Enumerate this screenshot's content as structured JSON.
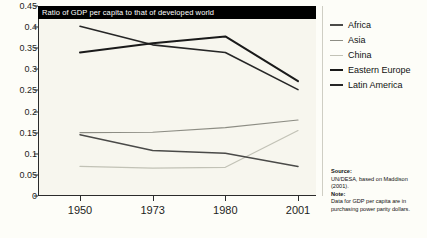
{
  "chart": {
    "title": "Ratio of GDP per capita to that of developed world",
    "source_heading": "Source:",
    "source_text": "UN/DESA, based on Maddison (2001).",
    "note_heading": "Note:",
    "note_text": "Data for GDP per capita are in purchasing power parity dollars."
  },
  "chart_data": {
    "type": "line",
    "title": "Ratio of GDP per capita to that of developed world",
    "xlabel": "",
    "ylabel": "",
    "x": [
      "1950",
      "1973",
      "1980",
      "2001"
    ],
    "categories": [
      "1950",
      "1973",
      "1980",
      "2001"
    ],
    "yticks": [
      0,
      0.05,
      0.1,
      0.15,
      0.2,
      0.25,
      0.3,
      0.35,
      0.4,
      0.45
    ],
    "ytick_labels": [
      "0",
      "0.05",
      "0.1",
      "0.15",
      "0.2",
      "0.25",
      "0.3",
      "0.35",
      "0.4",
      "0.45"
    ],
    "ylim": [
      0,
      0.45
    ],
    "grid": false,
    "legend_position": "right",
    "series": [
      {
        "name": "Africa",
        "color": "#4a4a48",
        "width": 1.5,
        "values": [
          0.145,
          0.108,
          0.101,
          0.07
        ]
      },
      {
        "name": "Asia",
        "color": "#8d8d84",
        "width": 1.2,
        "values": [
          0.15,
          0.151,
          0.162,
          0.18
        ]
      },
      {
        "name": "China",
        "color": "#c2c2b6",
        "width": 1.2,
        "values": [
          0.07,
          0.066,
          0.068,
          0.155
        ]
      },
      {
        "name": "Eastern Europe",
        "color": "#1a1a1a",
        "width": 2.0,
        "values": [
          0.34,
          0.362,
          0.378,
          0.272
        ]
      },
      {
        "name": "Latin America",
        "color": "#262626",
        "width": 1.6,
        "values": [
          0.402,
          0.358,
          0.34,
          0.252
        ]
      }
    ]
  }
}
